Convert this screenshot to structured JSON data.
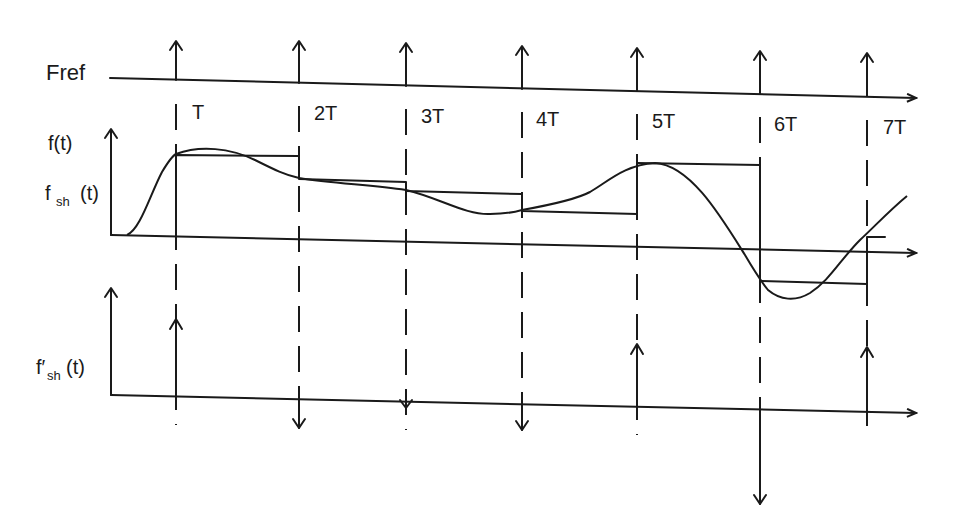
{
  "labels": {
    "fref": "Fref",
    "ft": "f(t)",
    "fsh_main": "f",
    "fsh_sub": "sh",
    "fsh_arg": "(t)",
    "fsh_prime_main": "f′",
    "fsh_prime_sub": "sh",
    "fsh_prime_arg": "(t)"
  },
  "time_marks": [
    {
      "label": "T",
      "x": 176
    },
    {
      "label": "2T",
      "x": 299
    },
    {
      "label": "3T",
      "x": 406
    },
    {
      "label": "4T",
      "x": 522
    },
    {
      "label": "5T",
      "x": 637
    },
    {
      "label": "6T",
      "x": 760
    },
    {
      "label": "7T",
      "x": 867
    }
  ],
  "colors": {
    "ink": "#1a1a1a",
    "background": "#ffffff"
  },
  "derivative_impulses": [
    {
      "at": "T",
      "direction": "up"
    },
    {
      "at": "2T",
      "direction": "down"
    },
    {
      "at": "3T",
      "direction": "down"
    },
    {
      "at": "4T",
      "direction": "down"
    },
    {
      "at": "5T",
      "direction": "up"
    },
    {
      "at": "6T",
      "direction": "down"
    },
    {
      "at": "7T",
      "direction": "up"
    }
  ]
}
